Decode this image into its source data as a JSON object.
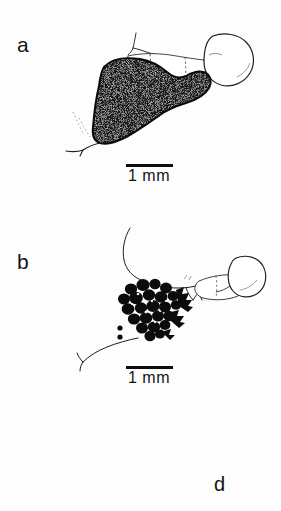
{
  "figure": {
    "background_color": "#fdfdfd",
    "ink_color": "#0d0d0d",
    "width": 281,
    "height": 511
  },
  "panels": [
    {
      "label": "a",
      "caption_subject": "stippled dark abdominal mass with outlined segmented thorax and rounded head capsule",
      "scalebar": {
        "label": "1 mm",
        "length_px": 47
      }
    },
    {
      "label": "b",
      "caption_subject": "cluster of dark rounded eggs attached to outlined body with thin curved filaments",
      "scalebar": {
        "label": "1 mm",
        "length_px": 47
      }
    }
  ],
  "stray_label": {
    "label": "d"
  },
  "scalebars": {
    "a": {
      "label": "1 mm"
    },
    "b": {
      "label": "1 mm"
    }
  }
}
